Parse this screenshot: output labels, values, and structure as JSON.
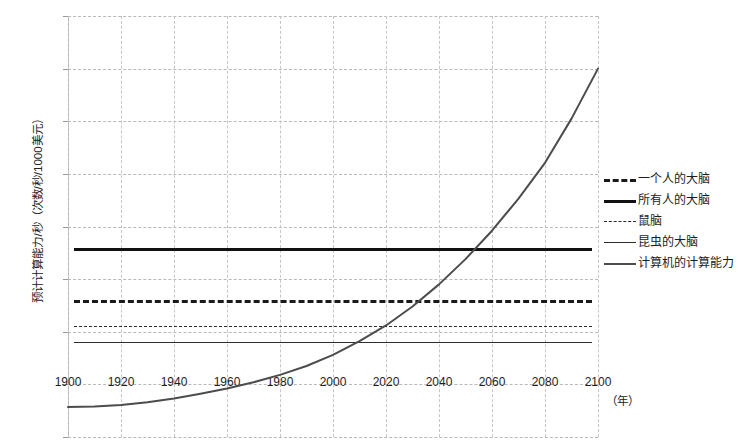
{
  "chart_data": {
    "type": "line",
    "title": "",
    "xlabel": "（年）",
    "ylabel": "预计计算能力/秒（次数/秒/1000美元）",
    "xlim": [
      1900,
      2100
    ],
    "ylim": [
      -10,
      70
    ],
    "x_ticks": [
      "1900",
      "1920",
      "1940",
      "1960",
      "1980",
      "2000",
      "2020",
      "2040",
      "2060",
      "2080",
      "2100"
    ],
    "y_ticks": [
      "70",
      "60",
      "50",
      "40",
      "30",
      "20",
      "10",
      "0",
      "-10"
    ],
    "grid": true,
    "legend_position": "right",
    "series": [
      {
        "name": "一个人的大脑",
        "style": "thick-dashed",
        "color": "#1a1a1a",
        "constant": 16,
        "x": [
          1900,
          2100
        ],
        "values": [
          16,
          16
        ]
      },
      {
        "name": "所有人的大脑",
        "style": "thick-solid",
        "color": "#111111",
        "constant": 26,
        "x": [
          1900,
          2100
        ],
        "values": [
          26,
          26
        ]
      },
      {
        "name": "鼠脑",
        "style": "thin-dashed",
        "color": "#2d2d2d",
        "constant": 11,
        "x": [
          1900,
          2100
        ],
        "values": [
          11,
          11
        ]
      },
      {
        "name": "昆虫的大脑",
        "style": "thin-solid",
        "color": "#2d2d2d",
        "constant": 8,
        "x": [
          1900,
          2100
        ],
        "values": [
          8,
          8
        ]
      },
      {
        "name": "计算机的计算能力",
        "style": "solid",
        "color": "#4c4c4c",
        "x": [
          1900,
          1910,
          1920,
          1930,
          1940,
          1950,
          1960,
          1970,
          1980,
          1990,
          2000,
          2010,
          2020,
          2030,
          2040,
          2050,
          2060,
          2070,
          2080,
          2090,
          2100
        ],
        "values": [
          -4.3,
          -4.2,
          -3.9,
          -3.4,
          -2.7,
          -1.8,
          -0.8,
          0.4,
          1.8,
          3.5,
          5.6,
          8.2,
          11.2,
          14.8,
          19.0,
          23.8,
          29.2,
          35.3,
          42.1,
          50.5,
          60.0
        ]
      }
    ],
    "annotations": []
  },
  "legend": {
    "items": [
      {
        "label": "一个人的大脑"
      },
      {
        "label": "所有人的大脑"
      },
      {
        "label": "鼠脑"
      },
      {
        "label": "昆虫的大脑"
      },
      {
        "label": "计算机的计算能力"
      }
    ]
  }
}
